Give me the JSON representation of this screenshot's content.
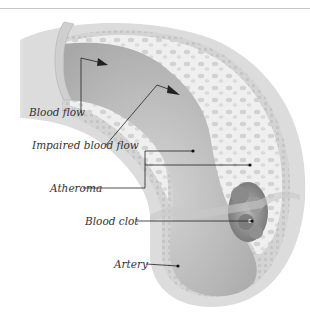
{
  "diagram": {
    "colors": {
      "wall_outer": "#d9d9d9",
      "wall_inner": "#c4c4c4",
      "atheroma": "#eeeeee",
      "lumen": "#bdbdbd",
      "clot": "#8f8f8f",
      "leader_line": "#222222",
      "label_text": "#333333"
    },
    "labels": [
      {
        "id": "blood-flow",
        "text": "Blood flow"
      },
      {
        "id": "impaired-blood-flow",
        "text": "Impaired blood flow"
      },
      {
        "id": "atheroma",
        "text": "Atheroma"
      },
      {
        "id": "blood-clot",
        "text": "Blood clot"
      },
      {
        "id": "artery",
        "text": "Artery"
      }
    ]
  }
}
